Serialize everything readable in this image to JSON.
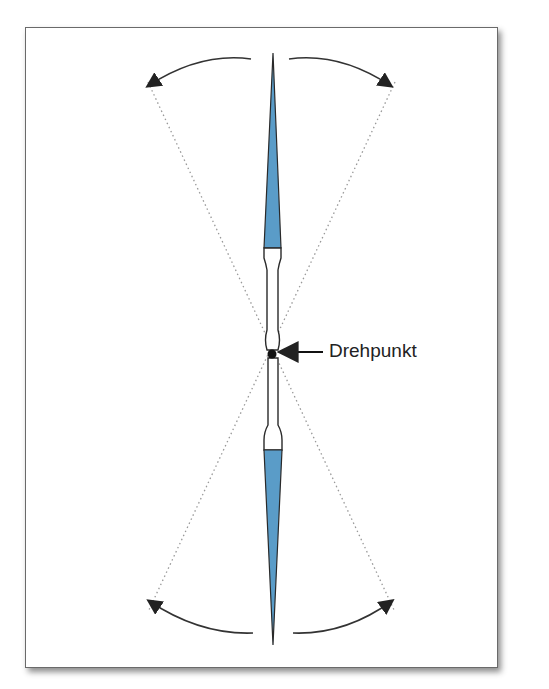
{
  "diagram": {
    "label": "Drehpunkt",
    "colors": {
      "blade": "#5a9cc8",
      "outline": "#2a2a2a",
      "arrow": "#333333",
      "dotted": "#999999",
      "frame_border": "#6a6a6a"
    },
    "elements": [
      "needle-top-blue-tip",
      "needle-bottom-blue-tip",
      "needle-shaft",
      "pivot-point",
      "swing-arrows",
      "dotted-range-lines"
    ]
  }
}
